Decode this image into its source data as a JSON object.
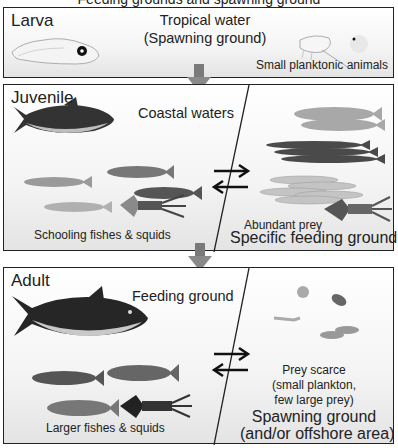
{
  "figure": {
    "title_partial": "Feeding grounds and spawning ground",
    "stages": [
      {
        "label": "Larva",
        "habitat": "Tropical water",
        "habitat_sub": "(Spawning ground)",
        "prey_label": "Small planktonic animals",
        "illustrations": [
          "larva-fish",
          "copepod",
          "fish-egg"
        ]
      },
      {
        "label": "Juvenile",
        "left_region": "Coastal waters",
        "left_caption": "Schooling fishes & squids",
        "right_caption_small": "Abundant prey",
        "right_region": "Specific feeding ground",
        "illustrations_left": [
          "juvenile-tuna",
          "sardine",
          "mackerel",
          "mackerel",
          "sardine",
          "squid"
        ],
        "illustrations_right": [
          "herring",
          "herring",
          "saury",
          "saury",
          "saury",
          "anchovy-school",
          "squid"
        ]
      },
      {
        "label": "Adult",
        "left_region": "Feeding ground",
        "left_caption": "Larger fishes & squids",
        "right_caption_line1": "Prey scarce",
        "right_caption_line2": "(small plankton,",
        "right_caption_line3": "few large prey)",
        "right_region": "Spawning ground",
        "right_region_sub": "(and/or offshore area)",
        "illustrations_left": [
          "adult-tuna",
          "mackerel",
          "mackerel",
          "mackerel",
          "squid"
        ],
        "illustrations_right": [
          "crab-larva",
          "pteropod",
          "shrimp",
          "small-fishes"
        ]
      }
    ],
    "colors": {
      "border": "#222222",
      "arrow_down": "#808080",
      "text": "#222222"
    }
  }
}
